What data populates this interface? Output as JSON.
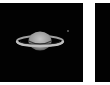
{
  "panels": [
    {
      "id": "left",
      "subject": "saturn",
      "background": "#020202",
      "planet_color": "#a8a8a8",
      "ring_color": "#b8b8b8",
      "moon_color": "#6a6a6a"
    },
    {
      "id": "right",
      "background": "#020202"
    }
  ],
  "background": "#ffffff"
}
